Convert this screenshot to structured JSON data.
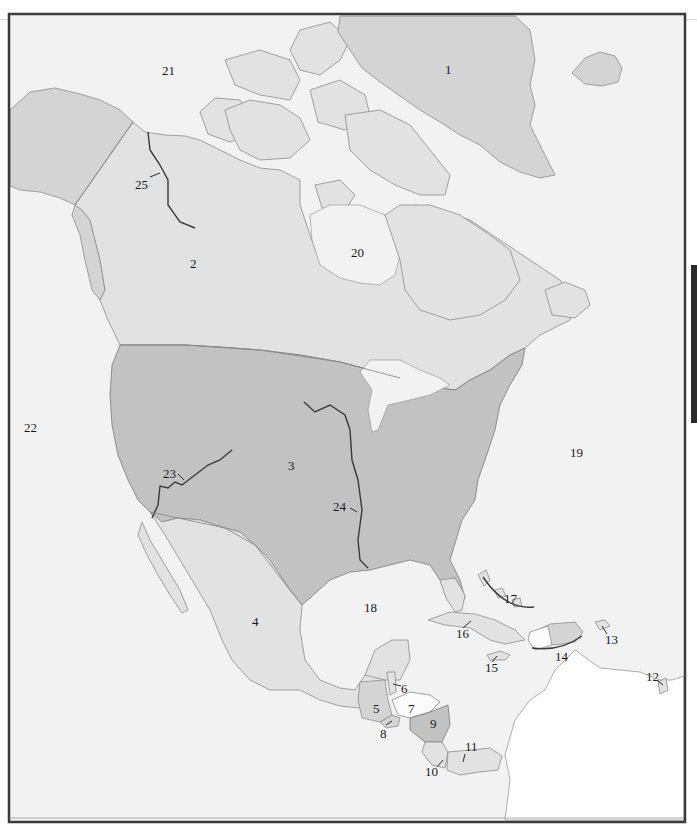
{
  "map": {
    "title": "North America outline map",
    "colors": {
      "water": "#f2f2f2",
      "land_light": "#e2e2e2",
      "land_mid": "#d4d4d4",
      "land_dark": "#c2c2c2",
      "frame": "#3a3a3a"
    },
    "labels": [
      {
        "id": "1",
        "text": "1",
        "feature": "Greenland"
      },
      {
        "id": "2",
        "text": "2",
        "feature": "Canada"
      },
      {
        "id": "3",
        "text": "3",
        "feature": "United States"
      },
      {
        "id": "4",
        "text": "4",
        "feature": "Mexico"
      },
      {
        "id": "5",
        "text": "5",
        "feature": "Guatemala"
      },
      {
        "id": "6",
        "text": "6",
        "feature": "Belize"
      },
      {
        "id": "7",
        "text": "7",
        "feature": "Honduras"
      },
      {
        "id": "8",
        "text": "8",
        "feature": "El Salvador"
      },
      {
        "id": "9",
        "text": "9",
        "feature": "Nicaragua"
      },
      {
        "id": "10",
        "text": "10",
        "feature": "Costa Rica"
      },
      {
        "id": "11",
        "text": "11",
        "feature": "Panama"
      },
      {
        "id": "12",
        "text": "12",
        "feature": "Trinidad and Tobago"
      },
      {
        "id": "13",
        "text": "13",
        "feature": "Puerto Rico"
      },
      {
        "id": "14",
        "text": "14",
        "feature": "Hispaniola"
      },
      {
        "id": "15",
        "text": "15",
        "feature": "Jamaica"
      },
      {
        "id": "16",
        "text": "16",
        "feature": "Cuba"
      },
      {
        "id": "17",
        "text": "17",
        "feature": "Bahamas"
      },
      {
        "id": "18",
        "text": "18",
        "feature": "Gulf of Mexico"
      },
      {
        "id": "19",
        "text": "19",
        "feature": "Atlantic Ocean"
      },
      {
        "id": "20",
        "text": "20",
        "feature": "Hudson Bay"
      },
      {
        "id": "21",
        "text": "21",
        "feature": "Arctic Ocean"
      },
      {
        "id": "22",
        "text": "22",
        "feature": "Pacific Ocean"
      },
      {
        "id": "23",
        "text": "23",
        "feature": "Colorado River"
      },
      {
        "id": "24",
        "text": "24",
        "feature": "Mississippi River"
      },
      {
        "id": "25",
        "text": "25",
        "feature": "Mackenzie River"
      }
    ]
  }
}
